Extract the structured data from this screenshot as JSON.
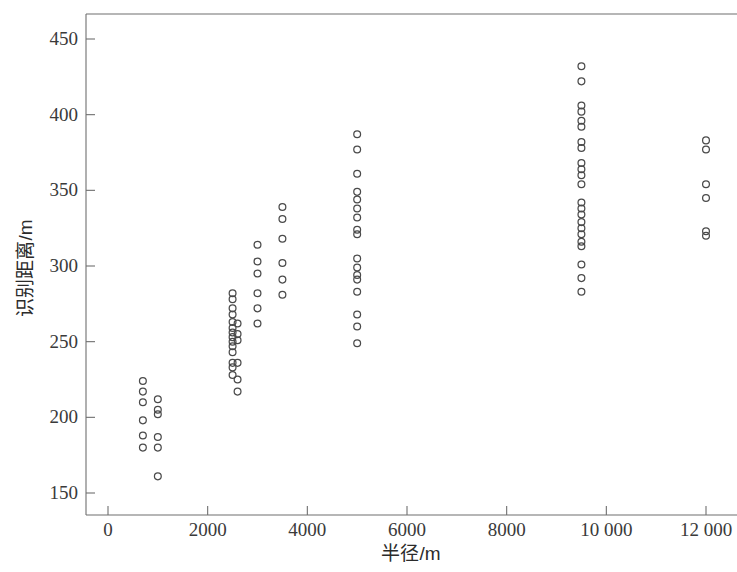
{
  "chart_data": {
    "type": "scatter",
    "title": "",
    "xlabel": "半径/m",
    "ylabel": "识别距离/m",
    "xlim": [
      -350,
      12800
    ],
    "ylim": [
      135,
      465
    ],
    "grid": false,
    "legend": "none",
    "marker": "open-circle",
    "xticks": [
      0,
      2000,
      4000,
      6000,
      8000,
      10000,
      12000
    ],
    "xticklabels": [
      "0",
      "2000",
      "4000",
      "6000",
      "8000",
      "10 000",
      "12 000"
    ],
    "yticks": [
      150,
      200,
      250,
      300,
      350,
      400,
      450
    ],
    "yticklabels": [
      "150",
      "200",
      "250",
      "300",
      "350",
      "400",
      "450"
    ],
    "series": [
      {
        "name": "识别距离观测点",
        "points": [
          [
            700,
            224
          ],
          [
            700,
            217
          ],
          [
            700,
            210
          ],
          [
            700,
            198
          ],
          [
            700,
            188
          ],
          [
            700,
            180
          ],
          [
            1000,
            212
          ],
          [
            1000,
            205
          ],
          [
            1000,
            202
          ],
          [
            1000,
            187
          ],
          [
            1000,
            180
          ],
          [
            1000,
            161
          ],
          [
            2500,
            282
          ],
          [
            2500,
            278
          ],
          [
            2500,
            272
          ],
          [
            2500,
            268
          ],
          [
            2500,
            263
          ],
          [
            2500,
            259
          ],
          [
            2500,
            256
          ],
          [
            2500,
            253
          ],
          [
            2500,
            250
          ],
          [
            2500,
            247
          ],
          [
            2500,
            243
          ],
          [
            2500,
            236
          ],
          [
            2500,
            233
          ],
          [
            2500,
            228
          ],
          [
            2600,
            262
          ],
          [
            2600,
            255
          ],
          [
            2600,
            251
          ],
          [
            2600,
            236
          ],
          [
            2600,
            225
          ],
          [
            2600,
            217
          ],
          [
            3000,
            314
          ],
          [
            3000,
            303
          ],
          [
            3000,
            295
          ],
          [
            3000,
            282
          ],
          [
            3000,
            272
          ],
          [
            3000,
            262
          ],
          [
            3500,
            339
          ],
          [
            3500,
            331
          ],
          [
            3500,
            318
          ],
          [
            3500,
            302
          ],
          [
            3500,
            291
          ],
          [
            3500,
            281
          ],
          [
            5000,
            387
          ],
          [
            5000,
            377
          ],
          [
            5000,
            361
          ],
          [
            5000,
            349
          ],
          [
            5000,
            344
          ],
          [
            5000,
            338
          ],
          [
            5000,
            332
          ],
          [
            5000,
            324
          ],
          [
            5000,
            321
          ],
          [
            5000,
            305
          ],
          [
            5000,
            299
          ],
          [
            5000,
            294
          ],
          [
            5000,
            291
          ],
          [
            5000,
            283
          ],
          [
            5000,
            268
          ],
          [
            5000,
            260
          ],
          [
            5000,
            249
          ],
          [
            9500,
            432
          ],
          [
            9500,
            422
          ],
          [
            9500,
            406
          ],
          [
            9500,
            402
          ],
          [
            9500,
            396
          ],
          [
            9500,
            392
          ],
          [
            9500,
            382
          ],
          [
            9500,
            378
          ],
          [
            9500,
            368
          ],
          [
            9500,
            364
          ],
          [
            9500,
            360
          ],
          [
            9500,
            354
          ],
          [
            9500,
            342
          ],
          [
            9500,
            338
          ],
          [
            9500,
            334
          ],
          [
            9500,
            329
          ],
          [
            9500,
            325
          ],
          [
            9500,
            321
          ],
          [
            9500,
            316
          ],
          [
            9500,
            313
          ],
          [
            9500,
            301
          ],
          [
            9500,
            292
          ],
          [
            9500,
            283
          ],
          [
            12000,
            383
          ],
          [
            12000,
            377
          ],
          [
            12000,
            354
          ],
          [
            12000,
            345
          ],
          [
            12000,
            323
          ],
          [
            12000,
            320
          ]
        ]
      }
    ]
  },
  "axes": {
    "y_title": "识别距离/m",
    "x_title": "半径/m"
  },
  "colors": {
    "marker_stroke": "#4a4a4a",
    "axis": "#6f6f6f",
    "background": "#ffffff"
  }
}
